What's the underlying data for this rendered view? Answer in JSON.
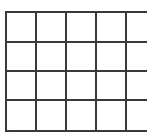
{
  "figure": {
    "columns": 5,
    "rows": 4,
    "background_color": "#ffffff",
    "line_color": "#3a3a3a",
    "line_width_px": 2,
    "outer_box": {
      "left_px": 5,
      "top_px": 11,
      "right_px": 142,
      "bottom_px": 130,
      "width_px": 137,
      "height_px": 119
    },
    "column_widths_px": [
      28,
      28,
      28,
      28,
      25
    ],
    "row_heights_px": [
      30,
      29,
      29,
      31
    ],
    "vertical_line_x_px": [
      5,
      33,
      61,
      89,
      117,
      142
    ],
    "horizontal_line_y_px": [
      11,
      41,
      70,
      99,
      130
    ],
    "cells": [
      [
        "",
        "",
        "",
        "",
        ""
      ],
      [
        "",
        "",
        "",
        "",
        ""
      ],
      [
        "",
        "",
        "",
        "",
        ""
      ],
      [
        "",
        "",
        "",
        "",
        ""
      ]
    ]
  }
}
